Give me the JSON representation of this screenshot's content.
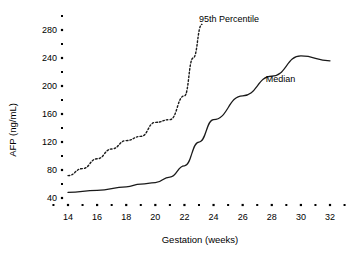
{
  "chart_data": {
    "type": "line",
    "title": "",
    "xlabel": "Gestation (weeks)",
    "ylabel": "AFP (ng/mL)",
    "xlim": [
      13,
      33
    ],
    "ylim": [
      20,
      300
    ],
    "grid": false,
    "legend_position": "inline-annotations",
    "x_ticks_major": [
      14,
      16,
      18,
      20,
      22,
      24,
      26,
      28,
      30,
      32
    ],
    "x_ticks_minor": [
      13,
      15,
      17,
      19,
      21,
      23,
      25,
      27,
      29,
      31,
      33
    ],
    "y_ticks_major": [
      40,
      80,
      120,
      160,
      200,
      240,
      280
    ],
    "y_ticks_minor": [
      60,
      100,
      140,
      180,
      220,
      260,
      300
    ],
    "x_tick_labels": [
      "14",
      "16",
      "18",
      "20",
      "22",
      "24",
      "26",
      "28",
      "30",
      "32"
    ],
    "y_tick_labels": [
      "40",
      "80",
      "120",
      "160",
      "200",
      "240",
      "280"
    ],
    "series": [
      {
        "name": "95th Percentile",
        "style": "dotted",
        "annotation": "95th Percentile",
        "x": [
          14,
          15,
          16,
          17,
          18,
          19,
          20,
          21,
          22,
          22.6,
          23.2
        ],
        "values": [
          72,
          82,
          96,
          110,
          122,
          128,
          148,
          152,
          186,
          240,
          288
        ]
      },
      {
        "name": "Median",
        "style": "solid",
        "annotation": "Median",
        "x": [
          14,
          16,
          18,
          19,
          20,
          21,
          22,
          23,
          24,
          26,
          28,
          30,
          32
        ],
        "values": [
          48,
          51,
          56,
          60,
          62,
          70,
          86,
          120,
          152,
          186,
          214,
          243,
          236
        ]
      }
    ],
    "annotations": [
      {
        "text": "95th Percentile",
        "x": 23.0,
        "y": 292
      },
      {
        "text": "Median",
        "x": 28.6,
        "y": 206
      }
    ]
  },
  "colors": {
    "ink": "#1a1a1a",
    "background": "#ffffff"
  }
}
